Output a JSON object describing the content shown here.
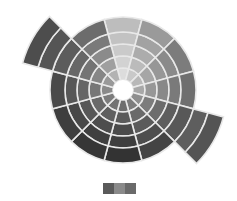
{
  "chart_data": {
    "type": "sunburst",
    "title": "",
    "center": [
      123,
      90
    ],
    "hole_radius": 10,
    "ring_radii": [
      10,
      22,
      34,
      46,
      58,
      73
    ],
    "extended_radii": [
      73,
      88,
      104
    ],
    "wedge_count": 12,
    "start_angle_deg": -105,
    "gap_color": "#e8e8e8",
    "wedges": [
      {
        "index": 0,
        "shades": [
          "#dcdcdc",
          "#d2d2d2",
          "#cacaca",
          "#c2c2c2",
          "#bdbdbd"
        ],
        "extended": false
      },
      {
        "index": 1,
        "shades": [
          "#c9c9c9",
          "#bbbbbb",
          "#acacac",
          "#a2a2a2",
          "#9a9a9a"
        ],
        "extended": false
      },
      {
        "index": 2,
        "shades": [
          "#b8b8b8",
          "#a6a6a6",
          "#979797",
          "#8a8a8a",
          "#7c7c7c"
        ],
        "extended": false
      },
      {
        "index": 3,
        "shades": [
          "#a8a8a8",
          "#979797",
          "#888888",
          "#7a7a7a",
          "#6f6f6f"
        ],
        "extended": false
      },
      {
        "index": 4,
        "shades": [
          "#8f8f8f",
          "#7c7c7c",
          "#6c6c6c",
          "#5e5e5e",
          "#585858"
        ],
        "extended": true,
        "extra_shades": [
          "#5e5e5e",
          "#545454"
        ]
      },
      {
        "index": 5,
        "shades": [
          "#7d7d7d",
          "#6a6a6a",
          "#5b5b5b",
          "#4e4e4e",
          "#444444"
        ],
        "extended": false
      },
      {
        "index": 6,
        "shades": [
          "#6e6e6e",
          "#5a5a5a",
          "#4a4a4a",
          "#3e3e3e",
          "#333333"
        ],
        "extended": false
      },
      {
        "index": 7,
        "shades": [
          "#737373",
          "#5f5f5f",
          "#4d4d4d",
          "#3f3f3f",
          "#363636"
        ],
        "extended": false
      },
      {
        "index": 8,
        "shades": [
          "#7c7c7c",
          "#696969",
          "#575757",
          "#484848",
          "#3e3e3e"
        ],
        "extended": false
      },
      {
        "index": 9,
        "shades": [
          "#8a8a8a",
          "#777777",
          "#666666",
          "#575757",
          "#4a4a4a"
        ],
        "extended": false
      },
      {
        "index": 10,
        "shades": [
          "#999999",
          "#868686",
          "#747474",
          "#676767",
          "#5c5c5c"
        ],
        "extended": true,
        "extra_shades": [
          "#555555",
          "#4d4d4d"
        ]
      },
      {
        "index": 11,
        "shades": [
          "#b2b2b2",
          "#9f9f9f",
          "#8b8b8b",
          "#7a7a7a",
          "#6c6c6c"
        ],
        "extended": false
      }
    ],
    "legend": {
      "position": "bottom-center",
      "swatches": [
        "#5a5a5a",
        "#8a8a8a",
        "#6a6a6a"
      ]
    }
  }
}
